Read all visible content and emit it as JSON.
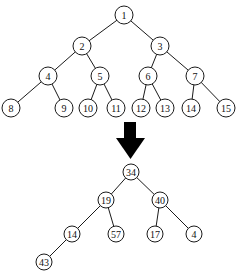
{
  "diagram": {
    "top_tree": {
      "node_radius": 9,
      "nodes": [
        {
          "id": "1",
          "label": "1",
          "x": 124,
          "y": 15
        },
        {
          "id": "2",
          "label": "2",
          "x": 82,
          "y": 46
        },
        {
          "id": "3",
          "label": "3",
          "x": 160,
          "y": 46
        },
        {
          "id": "4",
          "label": "4",
          "x": 48,
          "y": 76
        },
        {
          "id": "5",
          "label": "5",
          "x": 100,
          "y": 76
        },
        {
          "id": "6",
          "label": "6",
          "x": 148,
          "y": 76
        },
        {
          "id": "7",
          "label": "7",
          "x": 195,
          "y": 76
        },
        {
          "id": "8",
          "label": "8",
          "x": 11,
          "y": 108
        },
        {
          "id": "9",
          "label": "9",
          "x": 64,
          "y": 108
        },
        {
          "id": "10",
          "label": "10",
          "x": 88,
          "y": 108
        },
        {
          "id": "11",
          "label": "11",
          "x": 116,
          "y": 108
        },
        {
          "id": "12",
          "label": "12",
          "x": 141,
          "y": 108
        },
        {
          "id": "13",
          "label": "13",
          "x": 165,
          "y": 108
        },
        {
          "id": "14",
          "label": "14",
          "x": 191,
          "y": 108
        },
        {
          "id": "15",
          "label": "15",
          "x": 226,
          "y": 108
        }
      ],
      "edges": [
        [
          "1",
          "2"
        ],
        [
          "1",
          "3"
        ],
        [
          "2",
          "4"
        ],
        [
          "2",
          "5"
        ],
        [
          "3",
          "6"
        ],
        [
          "3",
          "7"
        ],
        [
          "4",
          "8"
        ],
        [
          "4",
          "9"
        ],
        [
          "5",
          "10"
        ],
        [
          "5",
          "11"
        ],
        [
          "6",
          "12"
        ],
        [
          "6",
          "13"
        ],
        [
          "7",
          "14"
        ],
        [
          "7",
          "15"
        ]
      ]
    },
    "arrow": {
      "direction": "down",
      "shaft": {
        "x": 124,
        "y": 122,
        "w": 12,
        "h": 17
      },
      "head": {
        "left": 116,
        "right": 145,
        "top": 138,
        "tip": 159
      },
      "color": "#000000"
    },
    "bottom_tree": {
      "node_radius": 8,
      "nodes": [
        {
          "id": "b34",
          "label": "34",
          "x": 131,
          "y": 172
        },
        {
          "id": "b19",
          "label": "19",
          "x": 106,
          "y": 200
        },
        {
          "id": "b40",
          "label": "40",
          "x": 160,
          "y": 200
        },
        {
          "id": "b14",
          "label": "14",
          "x": 72,
          "y": 234
        },
        {
          "id": "b57",
          "label": "57",
          "x": 116,
          "y": 234
        },
        {
          "id": "b17",
          "label": "17",
          "x": 155,
          "y": 234
        },
        {
          "id": "b4",
          "label": "4",
          "x": 194,
          "y": 234
        },
        {
          "id": "b43",
          "label": "43",
          "x": 44,
          "y": 262
        }
      ],
      "edges": [
        [
          "b34",
          "b19"
        ],
        [
          "b34",
          "b40"
        ],
        [
          "b19",
          "b14"
        ],
        [
          "b19",
          "b57"
        ],
        [
          "b40",
          "b17"
        ],
        [
          "b40",
          "b4"
        ],
        [
          "b14",
          "b43"
        ]
      ]
    }
  }
}
